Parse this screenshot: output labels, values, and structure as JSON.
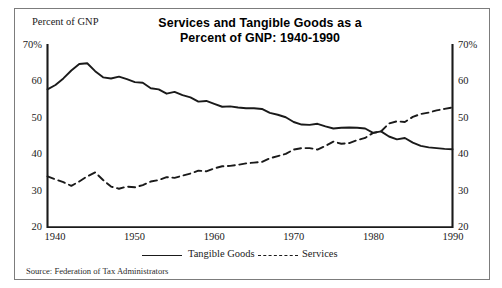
{
  "figure": {
    "title_line1": "Services and Tangible Goods as a",
    "title_line2": "Percent of GNP:  1940-1990",
    "axis_caption": "Percent of GNP",
    "source": "Source:  Federation of Tax Administrators",
    "border_color": "#7c7c7c",
    "line_color": "#1a1a1a",
    "background": "#ffffff"
  },
  "legend": {
    "tangible_label": "Tangible Goods",
    "services_label": "Services"
  },
  "chart_data": {
    "type": "line",
    "title": "Services and Tangible Goods as a Percent of GNP:  1940-1990",
    "xlabel": "",
    "ylabel": "Percent of GNP",
    "xlim": [
      1939,
      1990
    ],
    "ylim": [
      20,
      70
    ],
    "yticks": [
      20,
      30,
      40,
      50,
      60,
      70
    ],
    "ytick_labels_left": [
      "20",
      "30",
      "40",
      "50",
      "60",
      "70%"
    ],
    "ytick_labels_right": [
      "20",
      "30",
      "40",
      "50",
      "60",
      "70%"
    ],
    "xticks": [
      1940,
      1950,
      1960,
      1970,
      1980,
      1990
    ],
    "xtick_labels": [
      "1940",
      "1950",
      "1960",
      "1970",
      "1980",
      "1990"
    ],
    "grid": false,
    "legend_position": "below",
    "dual_y_axis": true,
    "x": [
      1939,
      1940,
      1941,
      1942,
      1943,
      1944,
      1945,
      1946,
      1947,
      1948,
      1949,
      1950,
      1951,
      1952,
      1953,
      1954,
      1955,
      1956,
      1957,
      1958,
      1959,
      1960,
      1961,
      1962,
      1963,
      1964,
      1965,
      1966,
      1967,
      1968,
      1969,
      1970,
      1971,
      1972,
      1973,
      1974,
      1975,
      1976,
      1977,
      1978,
      1979,
      1980,
      1981,
      1982,
      1983,
      1984,
      1985,
      1986,
      1987,
      1988,
      1989,
      1990
    ],
    "series": [
      {
        "name": "Tangible Goods",
        "style": "solid",
        "values": [
          58.0,
          59.2,
          61.0,
          63.2,
          65.0,
          65.2,
          63.0,
          61.3,
          61.0,
          61.5,
          60.8,
          60.0,
          59.8,
          58.3,
          58.0,
          56.8,
          57.3,
          56.4,
          55.8,
          54.6,
          54.8,
          54.0,
          53.2,
          53.3,
          53.0,
          52.8,
          52.8,
          52.6,
          51.5,
          51.0,
          50.3,
          49.0,
          48.3,
          48.2,
          48.5,
          47.8,
          47.2,
          47.4,
          47.5,
          47.4,
          47.2,
          46.0,
          46.4,
          45.0,
          44.2,
          44.6,
          43.3,
          42.4,
          42.0,
          41.8,
          41.6,
          41.5
        ]
      },
      {
        "name": "Services",
        "style": "dashed",
        "values": [
          34.0,
          33.2,
          32.4,
          31.4,
          32.6,
          34.0,
          35.1,
          33.0,
          31.2,
          30.6,
          31.2,
          31.0,
          31.6,
          32.6,
          33.0,
          33.8,
          33.6,
          34.2,
          34.8,
          35.6,
          35.4,
          36.2,
          36.8,
          36.9,
          37.2,
          37.6,
          37.8,
          38.0,
          39.0,
          39.6,
          40.2,
          41.4,
          41.8,
          41.8,
          41.4,
          42.4,
          43.6,
          43.0,
          43.2,
          44.0,
          44.6,
          46.0,
          46.4,
          48.6,
          49.2,
          49.0,
          50.4,
          51.2,
          51.6,
          52.2,
          52.6,
          53.0
        ]
      }
    ]
  }
}
